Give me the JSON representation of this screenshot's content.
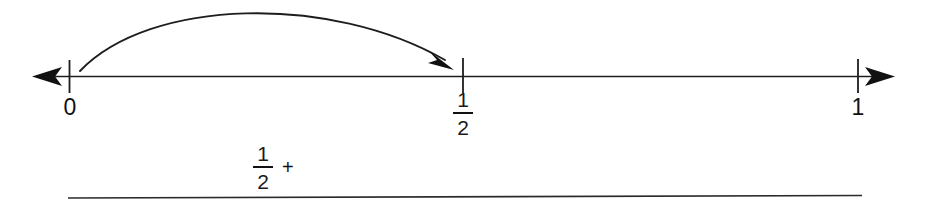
{
  "diagram": {
    "background_color": "#ffffff",
    "ink_color": "#111111"
  },
  "number_line": {
    "name": "number-line",
    "arrow_left": true,
    "arrow_right": true,
    "ticks": [
      {
        "value": "0",
        "label": "0",
        "type": "integer",
        "x": 70
      },
      {
        "value": "1/2",
        "label_numerator": "1",
        "label_denominator": "2",
        "type": "fraction",
        "x": 463
      },
      {
        "value": "1",
        "label": "1",
        "type": "integer",
        "x": 858
      }
    ]
  },
  "arc": {
    "name": "jump-arc",
    "from_label": "0",
    "to_label": "1/2",
    "direction": "rightward",
    "has_arrowhead": true
  },
  "expression": {
    "numerator": "1",
    "denominator": "2",
    "operator": "+"
  },
  "answer_rule": {
    "name": "answer-line",
    "visible": true
  }
}
